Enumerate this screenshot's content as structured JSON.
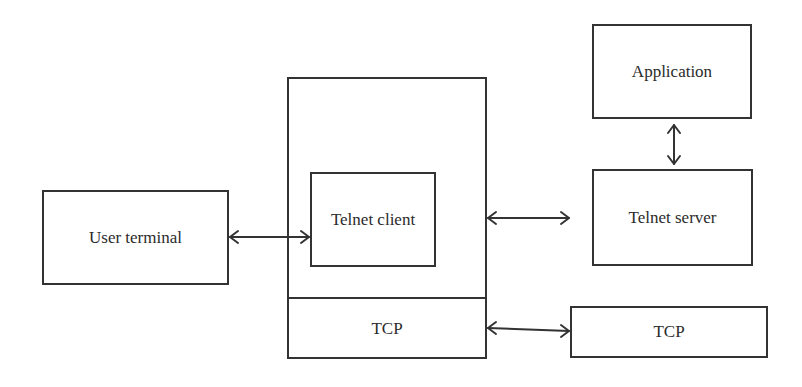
{
  "diagram": {
    "nodes": {
      "user_terminal": {
        "label": "User terminal"
      },
      "telnet_client": {
        "label": "Telnet client"
      },
      "client_tcp": {
        "label": "TCP"
      },
      "application": {
        "label": "Application"
      },
      "telnet_server": {
        "label": "Telnet server"
      },
      "server_tcp": {
        "label": "TCP"
      }
    },
    "edges": [
      {
        "from": "user_terminal",
        "to": "telnet_client",
        "direction": "bidirectional"
      },
      {
        "from": "client_host",
        "to": "telnet_server",
        "direction": "bidirectional"
      },
      {
        "from": "application",
        "to": "telnet_server",
        "direction": "bidirectional"
      },
      {
        "from": "client_tcp",
        "to": "server_tcp",
        "direction": "bidirectional"
      }
    ],
    "colors": {
      "stroke": "#333333",
      "background": "#ffffff",
      "text": "#2b2b2b"
    }
  }
}
